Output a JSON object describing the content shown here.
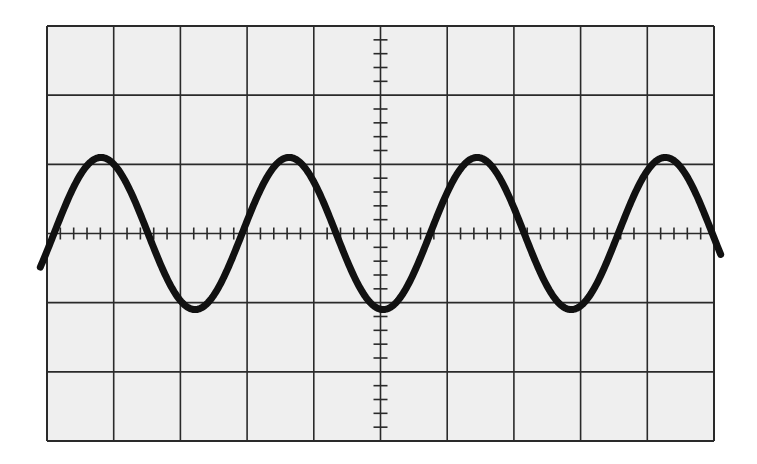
{
  "chart_data": {
    "type": "line",
    "title": "",
    "xlabel": "",
    "ylabel": "",
    "graticule": {
      "x_divisions": 10,
      "y_divisions": 6,
      "minor_ticks_per_division": 5,
      "grid": true,
      "center_axes_with_ticks": true
    },
    "xlim": [
      0,
      10
    ],
    "ylim": [
      -3,
      3
    ],
    "series": [
      {
        "name": "trace",
        "waveform": "sine",
        "amplitude_div": 1.1,
        "period_div": 2.82,
        "first_peak_x_div": 0.81,
        "offset_div": 0,
        "peaks_x_div": [
          0.81,
          3.66,
          6.42,
          9.26
        ],
        "troughs_x_div": [
          2.27,
          5.04,
          7.77
        ],
        "zero_crossings_x_div": [
          1.55,
          2.97,
          4.32,
          5.74,
          7.14,
          8.59
        ]
      }
    ],
    "x_range_drawn_div": [
      -0.1,
      10.1
    ]
  },
  "style": {
    "background": "#ffffff",
    "graticule_fill": "#efefef",
    "grid_color": "#2a2a2a",
    "trace_color": "#111111"
  }
}
